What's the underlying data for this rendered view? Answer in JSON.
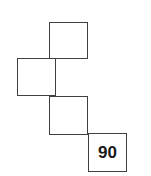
{
  "figure": {
    "type": "polyomino-staircase",
    "stroke_color": "#404040",
    "fill_color": "#ffffff",
    "background_color": "#ffffff",
    "square_size_px": 39,
    "squares": [
      {
        "id": "square-top",
        "label": "",
        "col": 1,
        "row": 0,
        "x": 49,
        "y": 22,
        "w": 39,
        "h": 37
      },
      {
        "id": "square-left",
        "label": "",
        "col": 0,
        "row": 1,
        "x": 17,
        "y": 58,
        "w": 39,
        "h": 38
      },
      {
        "id": "square-middle",
        "label": "",
        "col": 1,
        "row": 2,
        "x": 49,
        "y": 96,
        "w": 39,
        "h": 39
      },
      {
        "id": "square-bottom-right",
        "label": "90",
        "col": 2,
        "row": 3,
        "x": 88,
        "y": 133,
        "w": 39,
        "h": 39
      }
    ],
    "labels": {
      "value_90": "90"
    }
  }
}
